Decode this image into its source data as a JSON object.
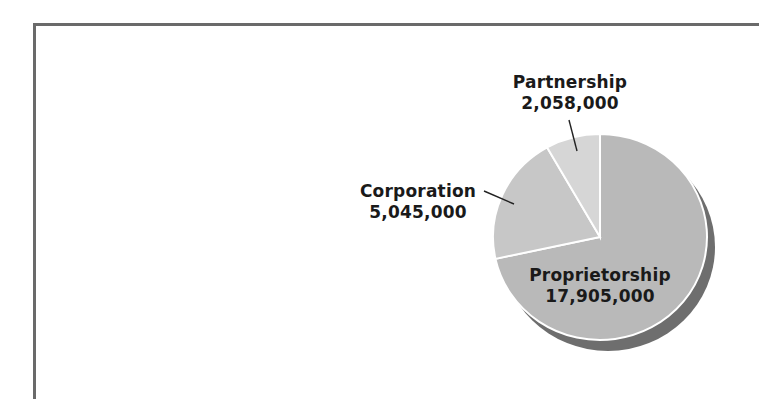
{
  "chart_data": {
    "type": "pie",
    "title": "",
    "categories": [
      "Proprietorship",
      "Corporation",
      "Partnership"
    ],
    "values": [
      17905000,
      5045000,
      2058000
    ],
    "value_labels": [
      "17,905,000",
      "5,045,000",
      "2,058,000"
    ],
    "colors": [
      "#b9b9b9",
      "#c7c7c7",
      "#d6d6d6"
    ],
    "shadow_color": "#6e6e6e",
    "start_angle": "12 o'clock",
    "direction": "clockwise",
    "legend": "none (direct labels)"
  },
  "labels": {
    "proprietorship": {
      "name": "Proprietorship",
      "value": "17,905,000"
    },
    "corporation": {
      "name": "Corporation",
      "value": "5,045,000"
    },
    "partnership": {
      "name": "Partnership",
      "value": "2,058,000"
    }
  }
}
